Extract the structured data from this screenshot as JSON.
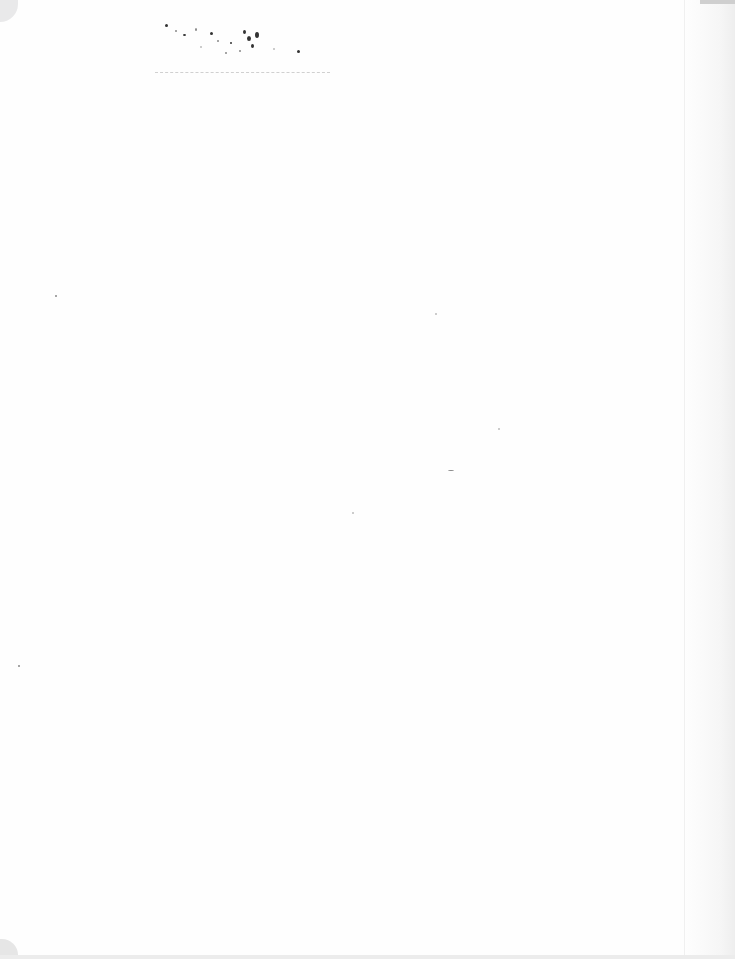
{
  "document": {
    "type": "scanned blank page",
    "text": ""
  },
  "colors": {
    "paper": "#fefefe",
    "noise": "#333333",
    "edge": "#eeeeee"
  }
}
